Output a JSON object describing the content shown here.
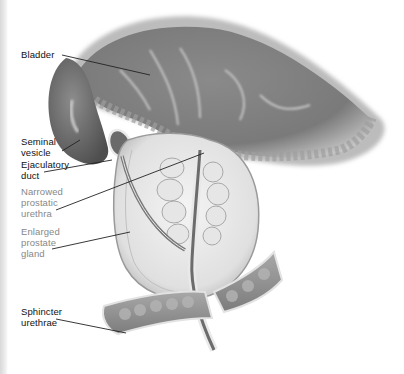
{
  "figure": {
    "labels": [
      {
        "id": "bladder",
        "lines": [
          "Bladder"
        ],
        "style": "dark"
      },
      {
        "id": "seminal-vesicle",
        "lines": [
          "Seminal",
          "vesicle"
        ],
        "style": "dark"
      },
      {
        "id": "ejaculatory-duct",
        "lines": [
          "Ejaculatory",
          "duct"
        ],
        "style": "dark"
      },
      {
        "id": "narrowed-prostatic-urethra",
        "lines": [
          "Narrowed",
          "prostatic",
          "urethra"
        ],
        "style": "muted"
      },
      {
        "id": "enlarged-prostate-gland",
        "lines": [
          "Enlarged",
          "prostate",
          "gland"
        ],
        "style": "muted"
      },
      {
        "id": "sphincter-urethrae",
        "lines": [
          "Sphincter",
          "urethrae"
        ],
        "style": "dark"
      }
    ]
  },
  "colors": {
    "label_dark": "#111111",
    "label_muted": "#888888",
    "leader_line": "#222222",
    "tissue_dark": "#6e6e6e",
    "tissue_mid": "#9a9a9a",
    "tissue_light": "#dcdcdc"
  }
}
